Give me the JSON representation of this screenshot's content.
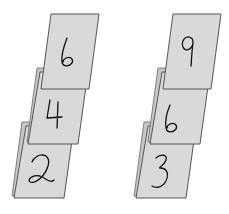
{
  "stacks": [
    {
      "name": "left-stack",
      "cards": [
        {
          "position": "top",
          "value": "6"
        },
        {
          "position": "middle",
          "value": "4"
        },
        {
          "position": "bottom",
          "value": "2"
        }
      ]
    },
    {
      "name": "right-stack",
      "cards": [
        {
          "position": "top",
          "value": "9"
        },
        {
          "position": "middle",
          "value": "6"
        },
        {
          "position": "bottom",
          "value": "3"
        }
      ]
    }
  ],
  "colors": {
    "card_fill": "#d9d9d9",
    "card_border": "#555555",
    "digit_ink": "#111111",
    "background": "#ffffff"
  }
}
